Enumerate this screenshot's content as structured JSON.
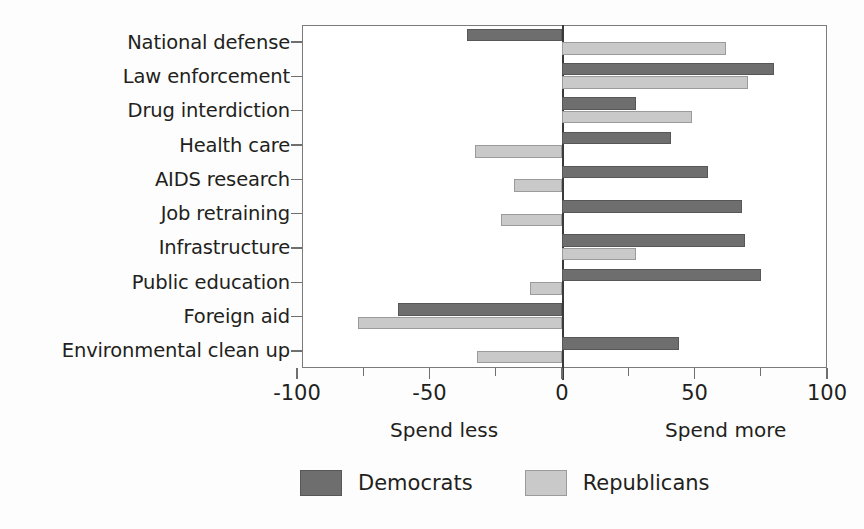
{
  "chart_data": {
    "type": "bar",
    "orientation": "horizontal",
    "title": "",
    "xlabel": "",
    "ylabel": "",
    "xlim": [
      -100,
      100
    ],
    "xticks": [
      -100,
      -50,
      0,
      50,
      100
    ],
    "xtick_labels": [
      "-100",
      "-50",
      "0",
      "50",
      "100"
    ],
    "grid": false,
    "legend_position": "bottom-center",
    "categories": [
      "National defense",
      "Law enforcement",
      "Drug interdiction",
      "Health care",
      "AIDS research",
      "Job retraining",
      "Infrastructure",
      "Public education",
      "Foreign aid",
      "Environmental clean up"
    ],
    "series": [
      {
        "name": "Democrats",
        "color": "#6e6e6e",
        "values": [
          -36,
          80,
          28,
          41,
          55,
          68,
          69,
          75,
          -62,
          44
        ]
      },
      {
        "name": "Republicans",
        "color": "#c9c9c9",
        "values": [
          62,
          70,
          49,
          -33,
          -18,
          -23,
          28,
          -12,
          -77,
          -32
        ]
      }
    ],
    "annotations": [
      {
        "text": "Spend less",
        "position": "below-axis-left"
      },
      {
        "text": "Spend more",
        "position": "below-axis-right"
      }
    ]
  },
  "axis": {
    "spend_less": "Spend less",
    "spend_more": "Spend more"
  },
  "legend": {
    "items": [
      {
        "label": "Democrats",
        "color": "#6e6e6e"
      },
      {
        "label": "Republicans",
        "color": "#c9c9c9"
      }
    ]
  }
}
